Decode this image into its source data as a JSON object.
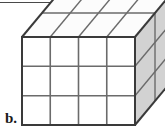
{
  "figure": {
    "part_label": "b.",
    "shape_name": "rectangular-prism-of-unit-cubes",
    "colors": {
      "outline": "#3a3a3a",
      "gridline": "#6b6b6b",
      "front_face_fill": "#ffffff",
      "top_face_fill": "#fcfcfc",
      "side_face_fill": "#d2d2d2",
      "rule": "#4a4a4a",
      "label_color": "#1a1a1a",
      "background": "#ffffff"
    },
    "dimensions": {
      "width_cubes": 4,
      "height_cubes": 3,
      "depth_cubes": 2,
      "total_cubes": 24
    },
    "geometry": {
      "front_left_x": 22,
      "front_right_x": 135,
      "front_top_y": 37,
      "front_bottom_y": 125,
      "depth_dx": 20,
      "depth_dy": -24
    },
    "faces": [
      {
        "name": "front-face",
        "rows": 3,
        "cols": 4,
        "shaded": false
      },
      {
        "name": "top-face",
        "rows": 2,
        "cols": 4,
        "shaded": false
      },
      {
        "name": "right-side-face",
        "rows": 3,
        "cols": 2,
        "shaded": true
      }
    ]
  }
}
